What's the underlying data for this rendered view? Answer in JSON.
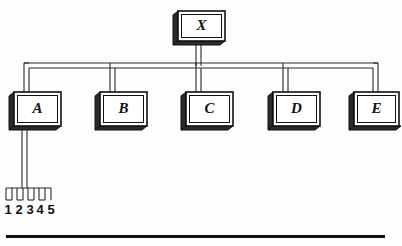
{
  "figure": {
    "background_color": "#fdfdfd",
    "line_color": "#2a2a2a",
    "box_fill_color": "#ffffff",
    "shadow_color": "#2b2b2b",
    "text_color": "#111111"
  },
  "root": {
    "label": "X"
  },
  "nodes": [
    {
      "label": "A"
    },
    {
      "label": "B"
    },
    {
      "label": "C"
    },
    {
      "label": "D"
    },
    {
      "label": "E"
    }
  ],
  "terminals": {
    "parent": "A",
    "labels": [
      "1",
      "2",
      "3",
      "4",
      "5"
    ]
  },
  "rule": {
    "present": true
  }
}
